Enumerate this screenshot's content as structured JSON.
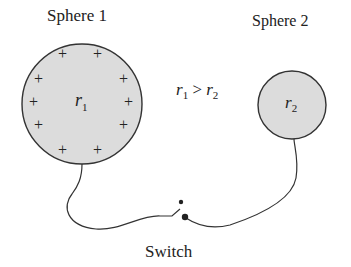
{
  "diagram": {
    "sphere1": {
      "label": "Sphere 1",
      "radius_label": "r",
      "radius_sub": "1",
      "charge_symbol": "+",
      "charge_count": 10,
      "fill": "#dcdcdc"
    },
    "sphere2": {
      "label": "Sphere 2",
      "radius_label": "r",
      "radius_sub": "2",
      "fill": "#dcdcdc"
    },
    "relation": {
      "left": "r",
      "left_sub": "1",
      "op": ">",
      "right": "r",
      "right_sub": "2"
    },
    "switch": {
      "label": "Switch",
      "state": "open"
    }
  }
}
